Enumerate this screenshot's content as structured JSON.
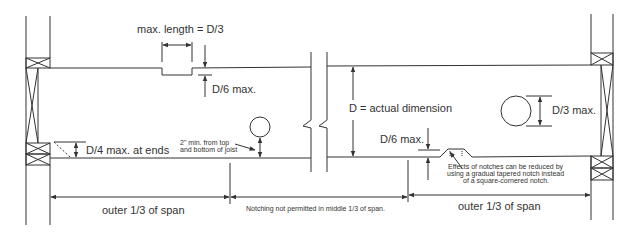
{
  "diagram": {
    "labels": {
      "max_length": "max. length = D/3",
      "d6_top": "D/6 max.",
      "d_actual": "D = actual dimension",
      "d3_hole": "D/3 max.",
      "d4_ends": "D/4 max. at ends",
      "two_inch_line1": "2\" min. from top",
      "two_inch_line2": "and bottom of joist",
      "d6_bottom": "D/6 max.",
      "effects_line1": "Effects of notches can be reduced by",
      "effects_line2": "using a gradual tapered notch instead",
      "effects_line3": "of a square-cornered notch.",
      "outer_left": "outer 1/3 of span",
      "middle": "Notching not permitted in middle 1/3 of span.",
      "outer_right": "outer 1/3 of span"
    },
    "colors": {
      "line": "#333333",
      "background": "#ffffff"
    }
  }
}
